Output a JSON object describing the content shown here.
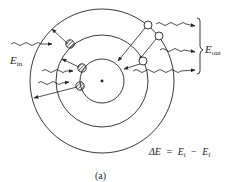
{
  "figure": {
    "caption": "(a)",
    "labels": {
      "e_in": {
        "main": "E",
        "sub": "in"
      },
      "e_out": {
        "main": "E",
        "sub": "out"
      }
    },
    "equation": {
      "lhs": "ΔE",
      "eq": "=",
      "t1": {
        "main": "E",
        "sub": "i"
      },
      "minus": "−",
      "t2": {
        "main": "E",
        "sub": "f"
      }
    },
    "orbits": [
      "inner",
      "middle",
      "outer"
    ],
    "absorbing_electrons_count": 3,
    "emitting_electrons_count": 3,
    "colors": {
      "ink": "#222222",
      "background": "#ffffff"
    }
  }
}
